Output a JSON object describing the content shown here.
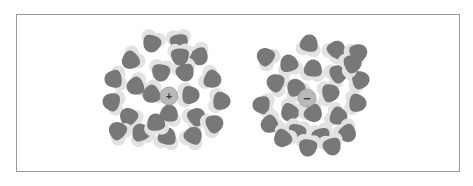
{
  "figure": {
    "background_color": "#ffffff",
    "frame": {
      "x": 16,
      "y": 14,
      "width": 444,
      "height": 158,
      "stroke": "#9a9a9a",
      "stroke_width": 1
    }
  },
  "colors": {
    "dark_gray": "#76787a",
    "light_gray": "#e2e2e2",
    "pale_gray": "#eeeeee",
    "ion_fill": "#b9b9b9",
    "ion_stroke": "#9d9d9d",
    "sign_color": "#3b3b3b",
    "frame_stroke": "#9a9a9a",
    "background": "#ffffff"
  },
  "chart_data": {
    "type": "scatter",
    "xlabel": "",
    "ylabel": "",
    "panels": [
      {
        "id": "cation-panel",
        "name": "positive-ion-solvation-shell",
        "ion_label": "+",
        "ion_charge": "positive",
        "ion_center": [
          169,
          96
        ],
        "ion_radius": 9,
        "molecule_count": 23,
        "molecule_orientation": "dark lobe points toward the ion",
        "molecules": [
          {
            "x": 152,
            "y": 43,
            "rot": 200
          },
          {
            "x": 179,
            "y": 42,
            "rot": 172
          },
          {
            "x": 199,
            "y": 56,
            "rot": 150
          },
          {
            "x": 131,
            "y": 60,
            "rot": 230
          },
          {
            "x": 161,
            "y": 72,
            "rot": 188
          },
          {
            "x": 185,
            "y": 72,
            "rot": 160
          },
          {
            "x": 212,
            "y": 79,
            "rot": 115
          },
          {
            "x": 114,
            "y": 79,
            "rot": 262
          },
          {
            "x": 136,
            "y": 86,
            "rot": 248
          },
          {
            "x": 152,
            "y": 94,
            "rot": 240
          },
          {
            "x": 190,
            "y": 95,
            "rot": 92
          },
          {
            "x": 221,
            "y": 101,
            "rot": 96
          },
          {
            "x": 112,
            "y": 102,
            "rot": 285
          },
          {
            "x": 169,
            "y": 114,
            "rot": 6
          },
          {
            "x": 196,
            "y": 117,
            "rot": 52
          },
          {
            "x": 129,
            "y": 117,
            "rot": 318
          },
          {
            "x": 214,
            "y": 124,
            "rot": 64
          },
          {
            "x": 141,
            "y": 133,
            "rot": 336
          },
          {
            "x": 167,
            "y": 137,
            "rot": 10
          },
          {
            "x": 193,
            "y": 136,
            "rot": 30
          },
          {
            "x": 118,
            "y": 131,
            "rot": 312
          },
          {
            "x": 156,
            "y": 123,
            "rot": 352
          },
          {
            "x": 180,
            "y": 56,
            "rot": 178
          }
        ]
      },
      {
        "id": "anion-panel",
        "name": "negative-ion-solvation-shell",
        "ion_label": "−",
        "ion_charge": "negative",
        "ion_center": [
          307,
          98
        ],
        "ion_radius": 9,
        "molecule_count": 24,
        "molecule_orientation": "light lobe points toward the ion",
        "molecules": [
          {
            "x": 309,
            "y": 44,
            "rot": 10
          },
          {
            "x": 336,
            "y": 50,
            "rot": 40
          },
          {
            "x": 358,
            "y": 53,
            "rot": 58
          },
          {
            "x": 266,
            "y": 57,
            "rot": 310
          },
          {
            "x": 289,
            "y": 64,
            "rot": 344
          },
          {
            "x": 313,
            "y": 69,
            "rot": 6
          },
          {
            "x": 338,
            "y": 74,
            "rot": 62
          },
          {
            "x": 276,
            "y": 83,
            "rot": 296
          },
          {
            "x": 360,
            "y": 80,
            "rot": 78
          },
          {
            "x": 296,
            "y": 88,
            "rot": 330
          },
          {
            "x": 330,
            "y": 93,
            "rot": 80
          },
          {
            "x": 262,
            "y": 105,
            "rot": 276
          },
          {
            "x": 357,
            "y": 103,
            "rot": 96
          },
          {
            "x": 290,
            "y": 112,
            "rot": 214
          },
          {
            "x": 313,
            "y": 113,
            "rot": 140
          },
          {
            "x": 338,
            "y": 116,
            "rot": 112
          },
          {
            "x": 270,
            "y": 124,
            "rot": 242
          },
          {
            "x": 297,
            "y": 132,
            "rot": 196
          },
          {
            "x": 321,
            "y": 136,
            "rot": 166
          },
          {
            "x": 347,
            "y": 133,
            "rot": 140
          },
          {
            "x": 283,
            "y": 138,
            "rot": 220
          },
          {
            "x": 308,
            "y": 147,
            "rot": 186
          },
          {
            "x": 332,
            "y": 146,
            "rot": 160
          },
          {
            "x": 352,
            "y": 64,
            "rot": 68
          }
        ]
      }
    ],
    "legend": []
  },
  "captions": {
    "left": "",
    "right": ""
  }
}
